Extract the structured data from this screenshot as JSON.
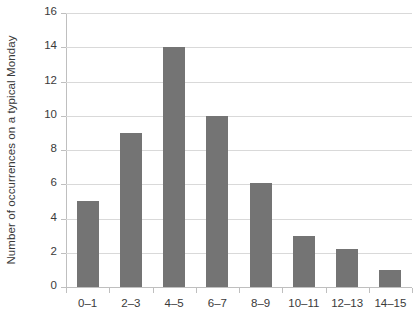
{
  "chart_data": {
    "type": "bar",
    "title": "",
    "subtitle": "",
    "xlabel": "",
    "ylabel": "Number of occurrences on a typical Monday",
    "categories": [
      "0–1",
      "2–3",
      "4–5",
      "6–7",
      "8–9",
      "10–11",
      "12–13",
      "14–15"
    ],
    "values": [
      5,
      9,
      14,
      10,
      6.1,
      3,
      2.2,
      1
    ],
    "ylim": [
      0,
      16
    ],
    "ytick_step": 2,
    "yticks": [
      "0",
      "2",
      "4",
      "6",
      "8",
      "10",
      "12",
      "14",
      "16"
    ],
    "grid": "horizontal",
    "legend": "none",
    "bar_color": "#747474",
    "gridline_color": "#d9d9d9",
    "axis_color": "#bfbfbf",
    "text_color": "#3a3a3a",
    "background": "#ffffff"
  }
}
